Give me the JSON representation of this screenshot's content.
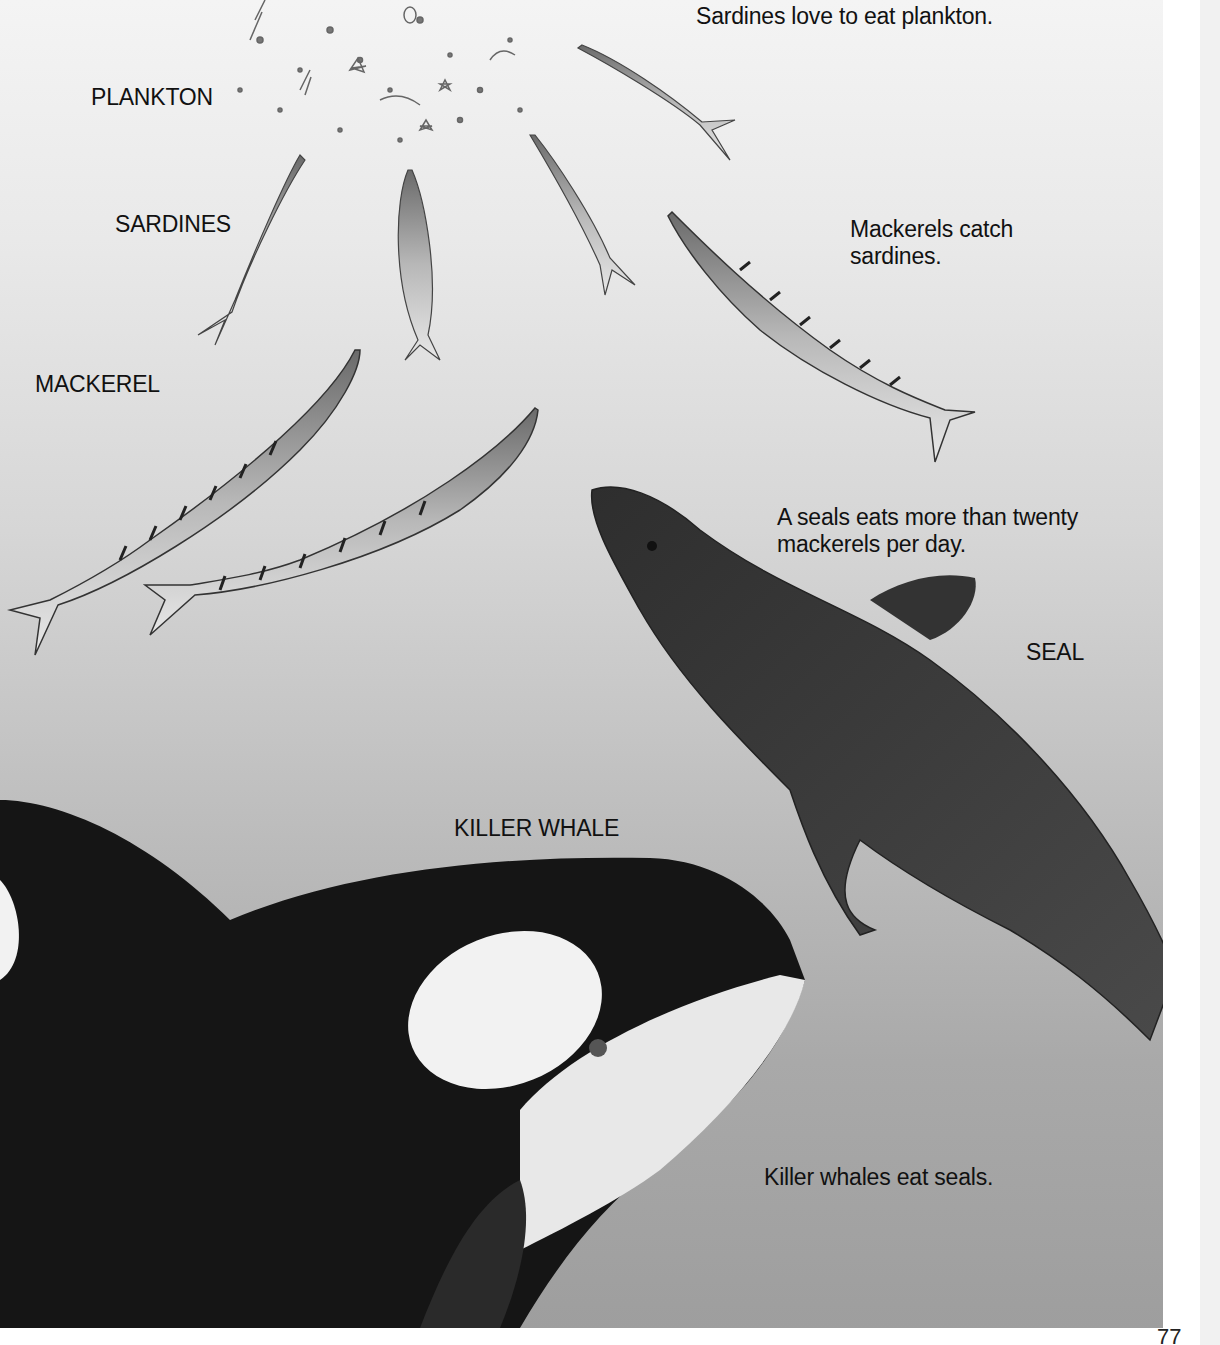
{
  "page": {
    "page_number": "77",
    "background_top_color": "#f4f4f4",
    "background_bottom_color": "#9e9e9e"
  },
  "labels": {
    "plankton": "PLANKTON",
    "sardines": "SARDINES",
    "mackerel": "MACKEREL",
    "seal": "SEAL",
    "killer_whale": "KILLER WHALE"
  },
  "captions": {
    "sardines_eat": "Sardines love to eat plankton.",
    "mackerels_catch": "Mackerels catch sardines.",
    "seal_eats": "A seals eats more than twenty mackerels per day.",
    "whales_eat": "Killer whales eat seals."
  },
  "figures": [
    {
      "name": "plankton-cluster",
      "depicts": "plankton"
    },
    {
      "name": "sardine",
      "count": 4
    },
    {
      "name": "mackerel",
      "count": 3
    },
    {
      "name": "seal",
      "count": 1
    },
    {
      "name": "killer-whale",
      "count": 1
    }
  ]
}
